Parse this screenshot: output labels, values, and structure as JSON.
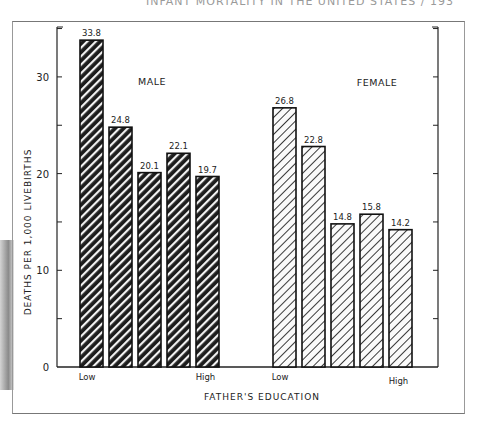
{
  "page": {
    "header_partial": "INFANT MORTALITY IN THE UNITED STATES / 193"
  },
  "chart_data": {
    "type": "bar",
    "title": "",
    "xlabel": "FATHER'S EDUCATION",
    "ylabel": "DEATHS PER 1,000 LIVEBIRTHS",
    "ylim": [
      0,
      35
    ],
    "yticks": [
      0,
      10,
      20,
      30
    ],
    "yticks_minor_step": 5,
    "grid": false,
    "groups": [
      {
        "name": "MALE",
        "fill": "dark-hatched",
        "categories": [
          "Low",
          "",
          "",
          "",
          "High"
        ],
        "values": [
          33.8,
          24.8,
          20.1,
          22.1,
          19.7
        ],
        "value_labels": [
          "33.8",
          "24.8",
          "20.1",
          "22.1",
          "19.7"
        ]
      },
      {
        "name": "FEMALE",
        "fill": "light-hatched",
        "categories": [
          "Low",
          "",
          "",
          "",
          "High"
        ],
        "values": [
          26.8,
          22.8,
          14.8,
          15.8,
          14.2
        ],
        "value_labels": [
          "26.8",
          "22.8",
          "14.8",
          "15.8",
          "14.2"
        ]
      }
    ],
    "colors": {
      "ink": "#1a1a1a",
      "dark_fill": "#2a2a2a",
      "light_fill": "#f4f4f4"
    }
  }
}
